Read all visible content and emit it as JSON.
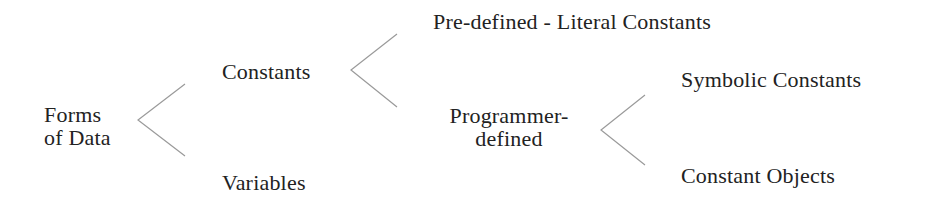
{
  "diagram": {
    "title": "Forms of Data",
    "line_color": "#9a9a9a",
    "text_color": "#222222",
    "nodes": {
      "root": {
        "lines": [
          "Forms",
          "of Data"
        ]
      },
      "constants": {
        "label": "Constants"
      },
      "variables": {
        "label": "Variables"
      },
      "predefined": {
        "label": "Pre-defined - Literal Constants"
      },
      "programmer_defined": {
        "lines": [
          "Programmer-",
          "defined"
        ]
      },
      "symbolic": {
        "label": "Symbolic Constants"
      },
      "constant_objects": {
        "label": "Constant Objects"
      }
    },
    "edges": [
      {
        "from": "root",
        "to": [
          "constants",
          "variables"
        ]
      },
      {
        "from": "constants",
        "to": [
          "predefined",
          "programmer_defined"
        ]
      },
      {
        "from": "programmer_defined",
        "to": [
          "symbolic",
          "constant_objects"
        ]
      }
    ]
  }
}
